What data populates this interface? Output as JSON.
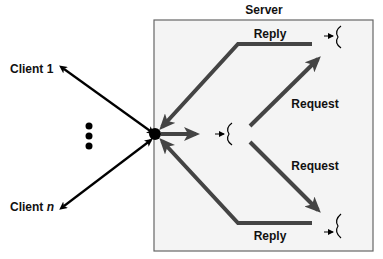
{
  "server": {
    "title": "Server"
  },
  "clients": {
    "first": {
      "prefix": "Client ",
      "suffix": "1"
    },
    "last": {
      "prefix": "Client ",
      "suffix": "n"
    }
  },
  "flows": {
    "reply_top": "Reply",
    "request_top": "Request",
    "request_bottom": "Request",
    "reply_bottom": "Reply"
  },
  "colors": {
    "server_bg": "#f4f4f4",
    "server_border": "#666666",
    "arrow_dark": "#444444",
    "arrow_black": "#000000"
  }
}
